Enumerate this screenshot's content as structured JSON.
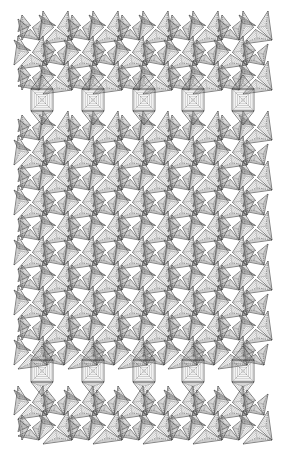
{
  "figure": {
    "width": 284,
    "height": 468,
    "background": "#ffffff",
    "stroke": "#4a4a4a",
    "fill_hatch": "#9a9a9a",
    "extent": {
      "x0": 18,
      "x1": 268,
      "y0": 15,
      "y1": 452
    },
    "square_rows_y": [
      100,
      371
    ],
    "square_cols_x": [
      42,
      93,
      144,
      193,
      243
    ],
    "square_size": 22,
    "triangle_cell": 25,
    "hatch_levels": 5
  }
}
